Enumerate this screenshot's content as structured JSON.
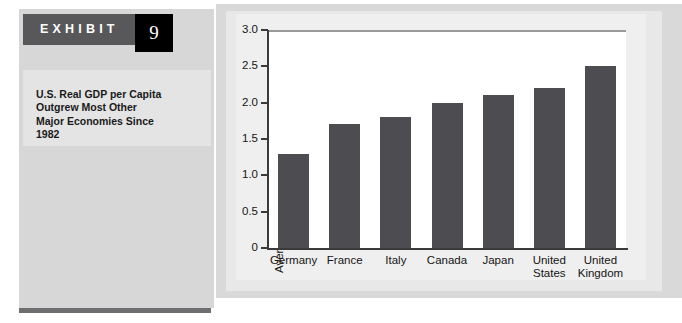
{
  "exhibit": {
    "label": "EXHIBIT",
    "number": "9",
    "caption": "U.S. Real GDP per Capita\nOutgrew Most Other\nMajor Economies Since\n1982"
  },
  "colors": {
    "band": "#58585b",
    "number_box": "#000000",
    "bar": "#4d4d51",
    "sidebar": "#d7d7d7",
    "caption_block": "#e4e4e4",
    "plot_background": "#ffffff",
    "axis": "#3a3a3a"
  },
  "chart_data": {
    "type": "bar",
    "title": "",
    "subtitle": "",
    "xlabel": "",
    "ylabel": "Average annual growth 1982–2002 (percent)",
    "categories": [
      "Germany",
      "France",
      "Italy",
      "Canada",
      "Japan",
      "United\nStates",
      "United\nKingdom"
    ],
    "values": [
      1.3,
      1.7,
      1.8,
      2.0,
      2.1,
      2.2,
      2.5
    ],
    "ylim": [
      0,
      3.0
    ],
    "yticks": [
      0,
      0.5,
      1.0,
      1.5,
      2.0,
      2.5,
      3.0
    ],
    "ytick_labels": [
      "0",
      "0.5",
      "1.0",
      "1.5",
      "2.0",
      "2.5",
      "3.0"
    ],
    "grid": false,
    "legend": false,
    "legend_position": "none",
    "series": [
      {
        "name": "Average annual growth 1982–2002 (percent)",
        "values": [
          1.3,
          1.7,
          1.8,
          2.0,
          2.1,
          2.2,
          2.5
        ]
      }
    ]
  }
}
